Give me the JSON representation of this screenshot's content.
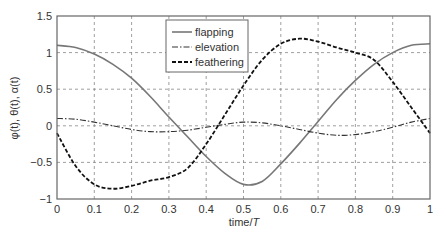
{
  "chart_data": {
    "type": "line",
    "title": "",
    "xlabel": "time/T",
    "ylabel": "φ(t), θ(t), α(t)",
    "xlim": [
      0,
      1
    ],
    "ylim": [
      -1,
      1.5
    ],
    "xticks": [
      "0",
      "0.1",
      "0.2",
      "0.3",
      "0.4",
      "0.5",
      "0.6",
      "0.7",
      "0.8",
      "0.9",
      "1"
    ],
    "yticks": [
      "−1",
      "−0.5",
      "0",
      "0.5",
      "1",
      "1.5"
    ],
    "grid": true,
    "legend_position": "upper center",
    "x": [
      0,
      0.05,
      0.1,
      0.15,
      0.2,
      0.25,
      0.3,
      0.35,
      0.4,
      0.45,
      0.5,
      0.55,
      0.6,
      0.65,
      0.7,
      0.75,
      0.8,
      0.85,
      0.9,
      0.95,
      1.0
    ],
    "series": [
      {
        "name": "flapping",
        "style": "solid",
        "color": "#777777",
        "values": [
          1.1,
          1.07,
          0.98,
          0.84,
          0.65,
          0.4,
          0.12,
          -0.15,
          -0.42,
          -0.65,
          -0.8,
          -0.76,
          -0.52,
          -0.24,
          0.06,
          0.36,
          0.62,
          0.84,
          1.0,
          1.1,
          1.12
        ]
      },
      {
        "name": "elevation",
        "style": "dashdot",
        "color": "#333333",
        "values": [
          0.1,
          0.09,
          0.05,
          0.0,
          -0.05,
          -0.08,
          -0.08,
          -0.06,
          -0.02,
          0.02,
          0.05,
          0.04,
          0.0,
          -0.05,
          -0.1,
          -0.13,
          -0.12,
          -0.08,
          -0.02,
          0.05,
          0.1
        ]
      },
      {
        "name": "feathering",
        "style": "dashed",
        "color": "#111111",
        "values": [
          -0.1,
          -0.55,
          -0.8,
          -0.86,
          -0.82,
          -0.75,
          -0.7,
          -0.58,
          -0.25,
          0.15,
          0.55,
          0.9,
          1.12,
          1.19,
          1.15,
          1.07,
          1.0,
          0.9,
          0.6,
          0.25,
          -0.1
        ]
      }
    ]
  }
}
